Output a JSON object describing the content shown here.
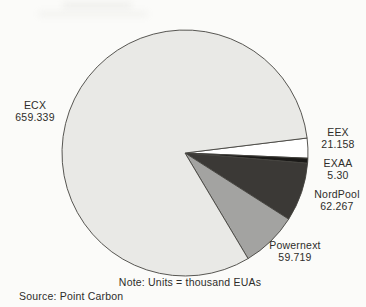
{
  "chart_data": {
    "type": "pie",
    "units_note": "Note: Units = thousand EUAs",
    "source": "Source: Point Carbon",
    "start_angle_deg": -7,
    "direction": "clockwise",
    "outline_color": "#45443f",
    "text_color": "#2e2d2a",
    "slices": [
      {
        "label": "EEX",
        "value": 21.158,
        "value_label": "21.158",
        "color": "#ffffff"
      },
      {
        "label": "EXAA",
        "value": 5.3,
        "value_label": "5.30",
        "color": "#1b1a18"
      },
      {
        "label": "NordPool",
        "value": 62.267,
        "value_label": "62.267",
        "color": "#3b3936"
      },
      {
        "label": "Powernext",
        "value": 59.719,
        "value_label": "59.719",
        "color": "#a3a3a1"
      },
      {
        "label": "ECX",
        "value": 659.339,
        "value_label": "659.339",
        "color": "#e9e9e6"
      }
    ]
  }
}
